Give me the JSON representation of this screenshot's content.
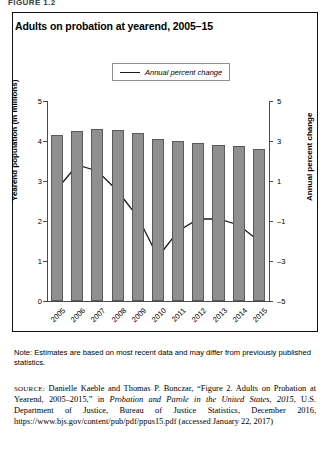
{
  "figure_label": "FIGURE 1.2",
  "title": "Adults on probation at yearend, 2005–15",
  "legend": {
    "label": "Annual percent change",
    "marker": "line-swatch"
  },
  "axes": {
    "left_title": "Yearend population (in millions)",
    "right_title": "Annual percent change",
    "left_ticks": [
      "5",
      "4",
      "3",
      "2",
      "1",
      "0"
    ],
    "right_ticks": [
      "5",
      "3",
      "1",
      "–1",
      "–3",
      "–5"
    ]
  },
  "note": "Note: Estimates are based on most recent data and may differ from previously published statistics.",
  "source": {
    "prefix": "SOURCE:",
    "text_1": " Danielle Kaeble and Thomas P. Bonczar, “Figure 2. Adults on Probation at Yearend, 2005–2015,” in ",
    "italic_1": "Probation and Parole in the United States, 2015",
    "text_2": ", U.S. Department of Justice, Bureau of Justice Statistics, December 2016, https://www.bjs.gov/content/pub/pdf/ppus15.pdf (accessed January 22, 2017)"
  },
  "chart_data": {
    "type": "bar",
    "title": "Adults on probation at yearend, 2005–15",
    "xlabel": "",
    "ylabel": "Yearend population (in millions)",
    "y2label": "Annual percent change",
    "categories": [
      "2005",
      "2006",
      "2007",
      "2008",
      "2009",
      "2010",
      "2011",
      "2012",
      "2013",
      "2014",
      "2015"
    ],
    "ylim": [
      0,
      5
    ],
    "y2lim": [
      -5,
      5
    ],
    "grid": false,
    "legend_position": "top-center",
    "series": [
      {
        "name": "Yearend population (in millions)",
        "type": "bar",
        "axis": "left",
        "color": "#8f8f8f",
        "values": [
          4.16,
          4.24,
          4.29,
          4.27,
          4.2,
          4.06,
          4.0,
          3.95,
          3.91,
          3.87,
          3.79
        ]
      },
      {
        "name": "Annual percent change",
        "type": "line",
        "axis": "right",
        "color": "#1a1a1a",
        "values": [
          0.6,
          1.8,
          1.5,
          0.5,
          -0.8,
          -2.8,
          -1.5,
          -0.9,
          -0.9,
          -1.2,
          -2.0
        ]
      }
    ]
  }
}
